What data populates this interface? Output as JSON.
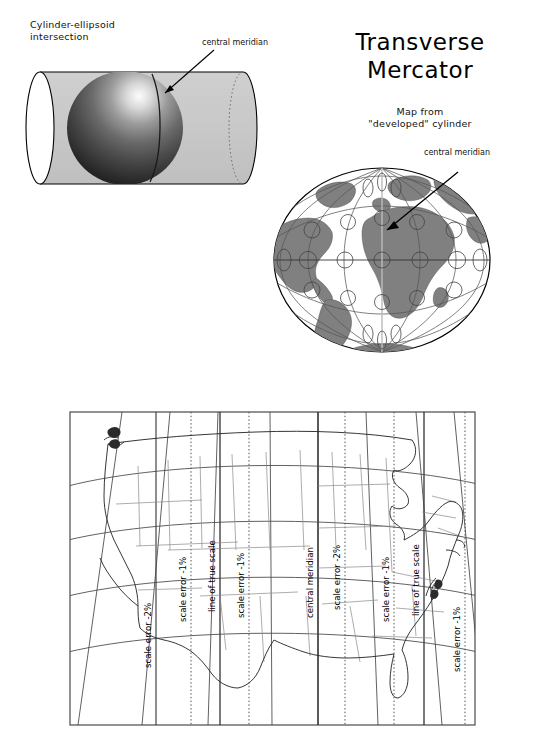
{
  "figure": {
    "title_line1": "Transverse",
    "title_line2": "Mercator"
  },
  "cylinder_panel": {
    "caption_line1": "Cylinder-ellipsoid",
    "caption_line2": "intersection",
    "annotation": "central meridian",
    "colors": {
      "cylinder_fill": "#c9c9c9",
      "sphere_light": "#f2f2f2",
      "sphere_dark": "#2c2c2c",
      "outline": "#000000",
      "hidden_edge": "#6e6e6e"
    }
  },
  "world_panel": {
    "caption_line1": "Map from",
    "caption_line2": "\"developed\" cylinder",
    "annotation": "central meridian",
    "colors": {
      "land": "#808080",
      "ocean": "#ffffff",
      "graticule": "#555555",
      "outline": "#000000"
    }
  },
  "usmap_panel": {
    "labels": [
      {
        "text": "scale error  -2%",
        "x": 108,
        "y": 660,
        "kind": "scale-error-minus-2-west"
      },
      {
        "text": "scale error  -1%",
        "x": 142,
        "y": 612,
        "kind": "scale-error-minus-1-west"
      },
      {
        "text": "line of true scale",
        "x": 171,
        "y": 600,
        "kind": "line-of-true-scale-west"
      },
      {
        "text": "scale error  -1%",
        "x": 200,
        "y": 608,
        "kind": "scale-error-minus-1-inner-west"
      },
      {
        "text": "central meridian",
        "x": 269,
        "y": 608,
        "kind": "central-meridian"
      },
      {
        "text": "scale error  -2%",
        "x": 296,
        "y": 600,
        "kind": "scale-error-minus-2-center"
      },
      {
        "text": "scale error  -1%",
        "x": 345,
        "y": 612,
        "kind": "scale-error-minus-1-east"
      },
      {
        "text": "line of true scale",
        "x": 375,
        "y": 605,
        "kind": "line-of-true-scale-east"
      },
      {
        "text": "scale error  -1%",
        "x": 417,
        "y": 660,
        "kind": "scale-error-minus-1-far-east"
      },
      {
        "text": "scale error  -2%",
        "x": 444,
        "y": 668,
        "kind": "scale-error-minus-2-east"
      }
    ],
    "colors": {
      "frame": "#4a4a4a",
      "state_line": "#777777",
      "coast_line": "#333333",
      "meridian": "#333333",
      "dotted_line": "#555555"
    }
  }
}
